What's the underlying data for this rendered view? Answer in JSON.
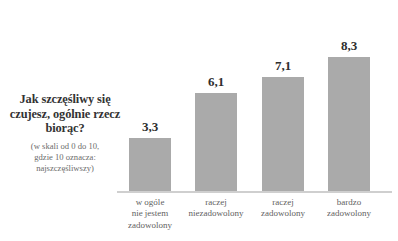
{
  "question": {
    "title_lines": [
      "Jak szczęśliwy",
      "się czujesz,",
      "ogólnie rzecz",
      "biorąc?"
    ],
    "title_text": "Jak szczęśliwy się czujesz, ogólnie rzecz biorąc?",
    "subtitle_lines": [
      "(w skali od 0 do 10,",
      "gdzie 10 oznacza:",
      "najszczęśliwszy)"
    ],
    "subtitle_text": "(w skali od 0 do 10, gdzie 10 oznacza: najszczęśliwszy)"
  },
  "style": {
    "bar_color": "#aaaaaa",
    "axis_color": "#cfcfcf",
    "value_color": "#2e2e2e",
    "title_color": "#333333",
    "label_color": "#5f5f5f",
    "subtitle_color": "#6b6b6b",
    "background": "#ffffff"
  },
  "chart_data": {
    "type": "bar",
    "title": "Jak szczęśliwy się czujesz, ogólnie rzecz biorąc?",
    "subtitle": "(w skali od 0 do 10, gdzie 10 oznacza: najszczęśliwszy)",
    "xlabel": "",
    "ylabel": "",
    "ylim": [
      0,
      10
    ],
    "grid": false,
    "legend": "none",
    "orientation": "vertical",
    "decimal_separator": ",",
    "categories": [
      "w ogóle nie jestem zadowolony",
      "raczej niezadowolony",
      "raczej zadowolony",
      "bardzo zadowolony"
    ],
    "category_lines": [
      [
        "w ogóle",
        "nie jestem",
        "zadowolony"
      ],
      [
        "raczej",
        "niezadowolony"
      ],
      [
        "raczej",
        "zadowolony"
      ],
      [
        "bardzo",
        "zadowolony"
      ]
    ],
    "values": [
      3.3,
      6.1,
      7.1,
      8.3
    ],
    "value_labels": [
      "3,3",
      "6,1",
      "7,1",
      "8,3"
    ],
    "bars": [
      {
        "label_lines": [
          "w ogóle",
          "nie jestem",
          "zadowolony"
        ],
        "value": 3.3,
        "value_label": "3,3"
      },
      {
        "label_lines": [
          "raczej",
          "niezadowolony"
        ],
        "value": 6.1,
        "value_label": "6,1"
      },
      {
        "label_lines": [
          "raczej",
          "zadowolony"
        ],
        "value": 7.1,
        "value_label": "7,1"
      },
      {
        "label_lines": [
          "bardzo",
          "zadowolony"
        ],
        "value": 8.3,
        "value_label": "8,3"
      }
    ]
  }
}
